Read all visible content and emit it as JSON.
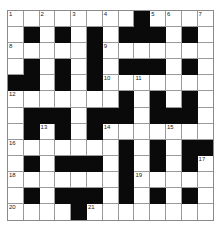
{
  "puzzle": {
    "type": "crossword",
    "rows": 13,
    "cols": 13,
    "colors": {
      "black": "#0a0a0a",
      "white": "#ffffff",
      "grid_line": "#9a9a9a"
    },
    "layout": [
      "WWWWWWWWBWWWW",
      "WBWBWBWBBBWBW",
      "WWWWWBWWWWWWW",
      "WBWBWBWBBBWBW",
      "BBWBWBWWWWWWW",
      "WWWWWWWBWBWBW",
      "WBBBWBBBWBBBW",
      "WBWBWBWWWWWWW",
      "WWWWWWWBWBWBB",
      "WBWBBBWBWBWBW",
      "WWWWWWWBWWWWW",
      "WBWBBBWBWBWBW",
      "WWWWBWWWWWWWW"
    ],
    "numbers": [
      {
        "n": "1",
        "r": 0,
        "c": 0
      },
      {
        "n": "2",
        "r": 0,
        "c": 2
      },
      {
        "n": "3",
        "r": 0,
        "c": 4
      },
      {
        "n": "4",
        "r": 0,
        "c": 6
      },
      {
        "n": "5",
        "r": 0,
        "c": 9
      },
      {
        "n": "6",
        "r": 0,
        "c": 10
      },
      {
        "n": "7",
        "r": 0,
        "c": 12
      },
      {
        "n": "8",
        "r": 2,
        "c": 0
      },
      {
        "n": "9",
        "r": 2,
        "c": 6
      },
      {
        "n": "10",
        "r": 4,
        "c": 6
      },
      {
        "n": "11",
        "r": 4,
        "c": 8
      },
      {
        "n": "12",
        "r": 5,
        "c": 0
      },
      {
        "n": "13",
        "r": 7,
        "c": 2
      },
      {
        "n": "14",
        "r": 7,
        "c": 6
      },
      {
        "n": "15",
        "r": 7,
        "c": 10
      },
      {
        "n": "16",
        "r": 8,
        "c": 0
      },
      {
        "n": "17",
        "r": 9,
        "c": 12
      },
      {
        "n": "18",
        "r": 10,
        "c": 0
      },
      {
        "n": "19",
        "r": 10,
        "c": 8
      },
      {
        "n": "20",
        "r": 12,
        "c": 0
      },
      {
        "n": "21",
        "r": 12,
        "c": 5
      }
    ]
  }
}
